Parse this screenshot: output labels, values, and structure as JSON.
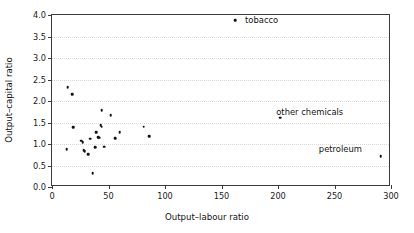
{
  "chart_data": {
    "type": "scatter",
    "title": "",
    "xlabel": "Output–labour ratio",
    "ylabel": "Output–capital ratio",
    "xlim": [
      0,
      300
    ],
    "ylim": [
      0,
      4.0
    ],
    "xticks": [
      0,
      50,
      100,
      150,
      200,
      250,
      300
    ],
    "yticks": [
      "0.0",
      "0.5",
      "1.0",
      "1.5",
      "2.0",
      "2.5",
      "3.0",
      "3.5",
      "4.0"
    ],
    "grid": "horizontal-dotted",
    "legend": "none",
    "marker": "filled-square-dot",
    "marker_color": "#111111",
    "points": [
      {
        "x": 13,
        "y": 0.88
      },
      {
        "x": 14,
        "y": 2.32
      },
      {
        "x": 18,
        "y": 2.16
      },
      {
        "x": 19,
        "y": 1.39
      },
      {
        "x": 26,
        "y": 1.08
      },
      {
        "x": 27,
        "y": 1.04
      },
      {
        "x": 28,
        "y": 0.85
      },
      {
        "x": 29,
        "y": 0.83
      },
      {
        "x": 32,
        "y": 0.76
      },
      {
        "x": 34,
        "y": 1.12
      },
      {
        "x": 36,
        "y": 0.32
      },
      {
        "x": 38,
        "y": 0.92
      },
      {
        "x": 39,
        "y": 1.28
      },
      {
        "x": 41,
        "y": 1.16
      },
      {
        "x": 42,
        "y": 1.15
      },
      {
        "x": 43,
        "y": 1.44
      },
      {
        "x": 44,
        "y": 1.4
      },
      {
        "x": 44,
        "y": 1.78
      },
      {
        "x": 46,
        "y": 0.94
      },
      {
        "x": 52,
        "y": 1.67
      },
      {
        "x": 56,
        "y": 1.13
      },
      {
        "x": 60,
        "y": 1.27
      },
      {
        "x": 81,
        "y": 1.4
      },
      {
        "x": 86,
        "y": 1.18
      },
      {
        "x": 162,
        "y": 3.88
      },
      {
        "x": 202,
        "y": 1.61
      },
      {
        "x": 291,
        "y": 0.72
      }
    ],
    "annotations": [
      {
        "label": "tobacco",
        "x": 162,
        "y": 3.88
      },
      {
        "label": "other chemicals",
        "x": 202,
        "y": 1.61
      },
      {
        "label": "petroleum",
        "x": 291,
        "y": 0.72
      }
    ]
  }
}
